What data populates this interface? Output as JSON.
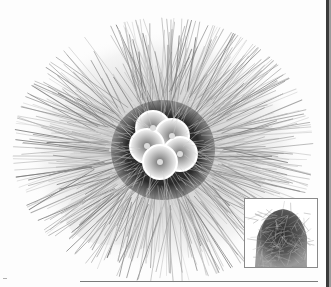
{
  "image": {
    "subject": "cactus-top-view-with-flowers",
    "palette": {
      "background": "#fdfdfd",
      "spine_light": "#c8c8c8",
      "spine_mid": "#8c8c8c",
      "core_dark": "#2e2e2e",
      "flower_petal": "#f2f2f2",
      "flower_mid": "#a8a8a8",
      "flower_center": "#6e6e6e",
      "page_edge": "#3a3a3a"
    },
    "main_photo": {
      "center_x": 163,
      "center_y": 148,
      "spine_radius": 135,
      "core_radius": 48,
      "flower_count": 5
    },
    "inset_photo": {
      "x": 244,
      "y": 198,
      "width": 74,
      "height": 70,
      "subject": "cactus-side-view"
    }
  }
}
